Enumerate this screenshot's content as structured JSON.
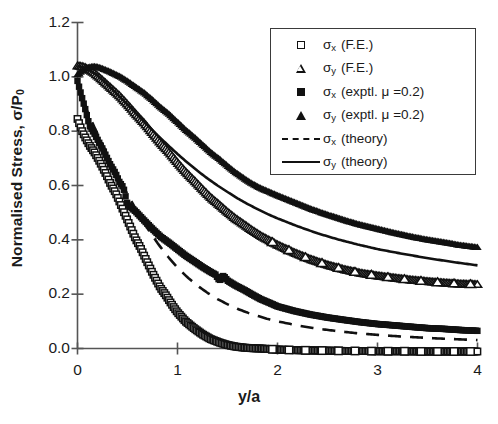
{
  "chart_data": {
    "type": "scatter",
    "title": "",
    "xlabel": "y/a",
    "ylabel": "Normalised Stress, σ/P₀",
    "xlim": [
      0,
      4
    ],
    "ylim": [
      0.0,
      1.2
    ],
    "xticks": [
      "0",
      "1",
      "2",
      "3",
      "4"
    ],
    "xtick_values": [
      0,
      1,
      2,
      3,
      4
    ],
    "yticks": [
      "0.0",
      "0.2",
      "0.4",
      "0.6",
      "0.8",
      "1.0",
      "1.2"
    ],
    "ytick_values": [
      0.0,
      0.2,
      0.4,
      0.6,
      0.8,
      1.0,
      1.2
    ],
    "grid": false,
    "legend_position": "upper right",
    "series": [
      {
        "name": "σx (F.E.)",
        "marker": "open-square",
        "style": "markers",
        "x": [
          0.0,
          0.04,
          0.08,
          0.12,
          0.17,
          0.21,
          0.25,
          0.29,
          0.33,
          0.38,
          0.42,
          0.46,
          0.5,
          0.54,
          0.58,
          0.63,
          0.67,
          0.71,
          0.75,
          0.79,
          0.83,
          0.88,
          0.92,
          0.96,
          1.0,
          1.08,
          1.17,
          1.25,
          1.33,
          1.42,
          1.5,
          1.58,
          1.67,
          1.75,
          1.83,
          1.92,
          2.0,
          2.17,
          2.33,
          2.5,
          2.67,
          2.83,
          3.0,
          3.25,
          3.5,
          3.75,
          4.0
        ],
        "y": [
          0.845,
          0.805,
          0.775,
          0.748,
          0.722,
          0.696,
          0.668,
          0.638,
          0.606,
          0.574,
          0.54,
          0.506,
          0.472,
          0.438,
          0.404,
          0.371,
          0.339,
          0.308,
          0.278,
          0.25,
          0.223,
          0.198,
          0.175,
          0.153,
          0.133,
          0.1,
          0.073,
          0.052,
          0.035,
          0.022,
          0.013,
          0.007,
          0.003,
          0.001,
          0.0,
          -0.002,
          -0.004,
          -0.006,
          -0.007,
          -0.008,
          -0.009,
          -0.009,
          -0.01,
          -0.01,
          -0.011,
          -0.011,
          -0.011
        ]
      },
      {
        "name": "σy (F.E.)",
        "marker": "open-triangle",
        "style": "markers",
        "x": [
          0.0,
          0.04,
          0.08,
          0.12,
          0.17,
          0.21,
          0.25,
          0.33,
          0.42,
          0.5,
          0.58,
          0.67,
          0.75,
          0.83,
          0.92,
          1.0,
          1.08,
          1.17,
          1.25,
          1.33,
          1.42,
          1.5,
          1.58,
          1.67,
          1.75,
          1.83,
          1.92,
          2.0,
          2.17,
          2.33,
          2.5,
          2.67,
          2.83,
          3.0,
          3.17,
          3.33,
          3.5,
          3.67,
          3.83,
          4.0
        ],
        "y": [
          1.04,
          1.038,
          1.033,
          1.025,
          1.013,
          1.0,
          0.987,
          0.96,
          0.93,
          0.898,
          0.864,
          0.828,
          0.792,
          0.756,
          0.72,
          0.684,
          0.65,
          0.617,
          0.586,
          0.556,
          0.528,
          0.502,
          0.478,
          0.455,
          0.434,
          0.415,
          0.397,
          0.381,
          0.352,
          0.328,
          0.307,
          0.29,
          0.277,
          0.267,
          0.259,
          0.252,
          0.246,
          0.241,
          0.237,
          0.235
        ]
      },
      {
        "name": "σx (exptl. μ =0.2)",
        "marker": "filled-square",
        "style": "markers",
        "x": [
          0.0,
          0.04,
          0.08,
          0.12,
          0.17,
          0.21,
          0.25,
          0.29,
          0.33,
          0.38,
          0.42,
          0.46,
          0.5,
          0.58,
          0.67,
          0.75,
          0.83,
          0.92,
          1.0,
          1.08,
          1.17,
          1.25,
          1.33,
          1.38,
          1.42,
          1.46,
          1.5,
          1.58,
          1.67,
          1.75,
          1.83,
          1.92,
          2.0,
          2.17,
          2.33,
          2.5,
          2.67,
          2.83,
          3.0,
          3.17,
          3.33,
          3.5,
          3.67,
          3.83,
          4.0
        ],
        "y": [
          0.985,
          0.93,
          0.878,
          0.82,
          0.79,
          0.762,
          0.735,
          0.705,
          0.675,
          0.645,
          0.612,
          0.592,
          0.53,
          0.505,
          0.47,
          0.44,
          0.412,
          0.388,
          0.365,
          0.342,
          0.32,
          0.3,
          0.282,
          0.272,
          0.25,
          0.268,
          0.25,
          0.232,
          0.215,
          0.198,
          0.182,
          0.168,
          0.155,
          0.138,
          0.125,
          0.114,
          0.105,
          0.097,
          0.09,
          0.085,
          0.08,
          0.075,
          0.072,
          0.068,
          0.065
        ]
      },
      {
        "name": "σy (exptl. μ =0.2)",
        "marker": "filled-triangle",
        "style": "markers",
        "x": [
          0.0,
          0.04,
          0.08,
          0.12,
          0.17,
          0.21,
          0.25,
          0.33,
          0.42,
          0.5,
          0.58,
          0.67,
          0.75,
          0.83,
          0.92,
          1.0,
          1.08,
          1.17,
          1.25,
          1.33,
          1.42,
          1.5,
          1.58,
          1.67,
          1.75,
          1.83,
          1.92,
          2.0,
          2.17,
          2.33,
          2.5,
          2.67,
          2.83,
          3.0,
          3.17,
          3.33,
          3.5,
          3.67,
          3.83,
          4.0
        ],
        "y": [
          1.008,
          1.02,
          1.03,
          1.036,
          1.038,
          1.035,
          1.03,
          1.018,
          1.002,
          0.984,
          0.963,
          0.94,
          0.915,
          0.888,
          0.861,
          0.833,
          0.805,
          0.777,
          0.75,
          0.723,
          0.697,
          0.672,
          0.648,
          0.625,
          0.606,
          0.59,
          0.576,
          0.563,
          0.538,
          0.514,
          0.492,
          0.472,
          0.455,
          0.44,
          0.425,
          0.412,
          0.4,
          0.39,
          0.38,
          0.372
        ]
      },
      {
        "name": "σx (theory)",
        "marker": "none",
        "style": "dashed-line",
        "x": [
          0.0,
          0.1,
          0.2,
          0.3,
          0.4,
          0.5,
          0.6,
          0.7,
          0.8,
          0.9,
          1.0,
          1.1,
          1.2,
          1.3,
          1.4,
          1.5,
          1.6,
          1.7,
          1.8,
          1.9,
          2.0,
          2.2,
          2.4,
          2.6,
          2.8,
          3.0,
          3.2,
          3.4,
          3.6,
          3.8,
          4.0
        ],
        "y": [
          0.985,
          0.87,
          0.79,
          0.712,
          0.638,
          0.568,
          0.502,
          0.442,
          0.388,
          0.34,
          0.298,
          0.262,
          0.231,
          0.205,
          0.182,
          0.163,
          0.146,
          0.132,
          0.12,
          0.109,
          0.1,
          0.085,
          0.073,
          0.064,
          0.056,
          0.05,
          0.045,
          0.041,
          0.037,
          0.034,
          0.031
        ]
      },
      {
        "name": "σy (theory)",
        "marker": "none",
        "style": "solid-line",
        "x": [
          0.0,
          0.1,
          0.2,
          0.3,
          0.4,
          0.5,
          0.6,
          0.7,
          0.8,
          0.9,
          1.0,
          1.1,
          1.2,
          1.3,
          1.4,
          1.5,
          1.6,
          1.7,
          1.8,
          1.9,
          2.0,
          2.2,
          2.4,
          2.6,
          2.8,
          3.0,
          3.2,
          3.4,
          3.6,
          3.8,
          4.0
        ],
        "y": [
          1.04,
          1.03,
          1.005,
          0.972,
          0.935,
          0.898,
          0.86,
          0.822,
          0.785,
          0.75,
          0.716,
          0.684,
          0.654,
          0.626,
          0.6,
          0.576,
          0.553,
          0.532,
          0.513,
          0.495,
          0.479,
          0.45,
          0.424,
          0.402,
          0.383,
          0.366,
          0.352,
          0.339,
          0.327,
          0.316,
          0.306
        ]
      }
    ]
  },
  "legend": {
    "items": [
      {
        "marker": "open-square",
        "sym": "σ",
        "sub": "x",
        "paren": "(F.E.)"
      },
      {
        "marker": "open-triangle",
        "sym": "σ",
        "sub": "y",
        "paren": "(F.E.)"
      },
      {
        "marker": "filled-square",
        "sym": "σ",
        "sub": "x",
        "paren": "(exptl.  μ  =0.2)"
      },
      {
        "marker": "filled-triangle",
        "sym": "σ",
        "sub": "y",
        "paren": "(exptl.  μ  =0.2)"
      },
      {
        "marker": "dashed-line",
        "sym": "σ",
        "sub": "x",
        "paren": "(theory)"
      },
      {
        "marker": "solid-line",
        "sym": "σ",
        "sub": "y",
        "paren": "(theory)"
      }
    ]
  },
  "axes": {
    "ylabel_main": "Normalised Stress, σ/P",
    "ylabel_sub": "0",
    "xlabel": "y/a"
  },
  "colors": {
    "ink": "#111111",
    "axis": "#555555",
    "background": "#ffffff"
  }
}
